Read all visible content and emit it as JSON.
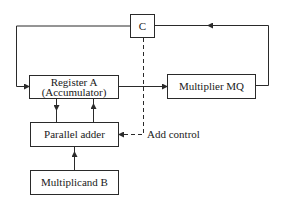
{
  "diagram": {
    "nodes": {
      "control": {
        "label": "C"
      },
      "register_a": {
        "line1": "Register A",
        "line2": "(Accumulator)"
      },
      "multiplier_mq": {
        "label": "Multiplier MQ"
      },
      "parallel_adder": {
        "label": "Parallel adder"
      },
      "multiplicand_b": {
        "label": "Multiplicand B"
      }
    },
    "annotations": {
      "add_control": "Add control"
    },
    "edges": [
      {
        "from": "register_a",
        "to": "multiplier_mq",
        "style": "solid"
      },
      {
        "from": "multiplier_mq",
        "to": "control",
        "style": "solid",
        "route": "right side up, then left along top"
      },
      {
        "from": "control",
        "to": "register_a",
        "style": "solid",
        "route": "left along top, down left side"
      },
      {
        "from": "register_a",
        "to": "parallel_adder",
        "style": "solid"
      },
      {
        "from": "parallel_adder",
        "to": "register_a",
        "style": "solid"
      },
      {
        "from": "multiplicand_b",
        "to": "parallel_adder",
        "style": "solid"
      },
      {
        "from": "control",
        "to": "parallel_adder",
        "style": "dashed",
        "label": "Add control"
      }
    ],
    "colors": {
      "line": "#2a2a2a",
      "background": "#ffffff"
    }
  }
}
